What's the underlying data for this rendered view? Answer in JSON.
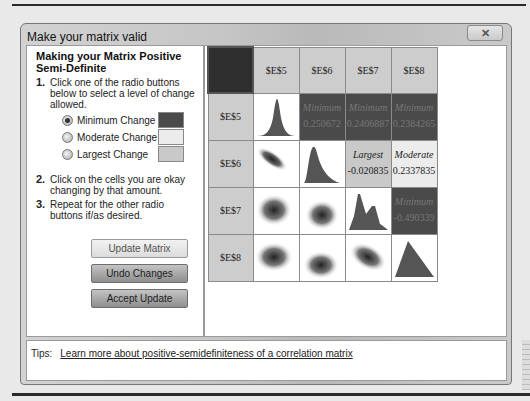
{
  "window": {
    "title": "Make your matrix valid",
    "close_icon": "close-x-icon"
  },
  "instructions": {
    "heading": "Making your Matrix Positive Semi-Definite",
    "steps": [
      {
        "num": "1.",
        "text": "Click one of the radio buttons below to select a level of change allowed."
      },
      {
        "num": "2.",
        "text": "Click on the cells you are okay changing by that amount."
      },
      {
        "num": "3.",
        "text": "Repeat for the other radio buttons if/as desired."
      }
    ],
    "options": [
      {
        "label": "Minimum Change",
        "checked": true,
        "color": "#4a4a4a"
      },
      {
        "label": "Moderate Change",
        "checked": false,
        "color": "#ececec"
      },
      {
        "label": "Largest Change",
        "checked": false,
        "color": "#c9c9c9"
      }
    ]
  },
  "buttons": {
    "update_matrix": "Update Matrix",
    "undo_changes": "Undo Changes",
    "accept_update": "Accept Update"
  },
  "matrix": {
    "headers": [
      "$E$5",
      "$E$6",
      "$E$7",
      "$E$8"
    ],
    "cells": {
      "r0c1": {
        "label": "Minimum",
        "value": "0.250672"
      },
      "r0c2": {
        "label": "Minimum",
        "value": "0.2406887"
      },
      "r0c3": {
        "label": "Minimum",
        "value": "0.2384265"
      },
      "r1c2": {
        "label": "Largest",
        "value": "-0.020835"
      },
      "r1c3": {
        "label": "Moderate",
        "value": "0.2337835"
      },
      "r2c3": {
        "label": "Minimum",
        "value": "-0.490339"
      }
    }
  },
  "tips": {
    "label": "Tips:",
    "link": "Learn more about positive-semidefiniteness of a correlation matrix"
  }
}
